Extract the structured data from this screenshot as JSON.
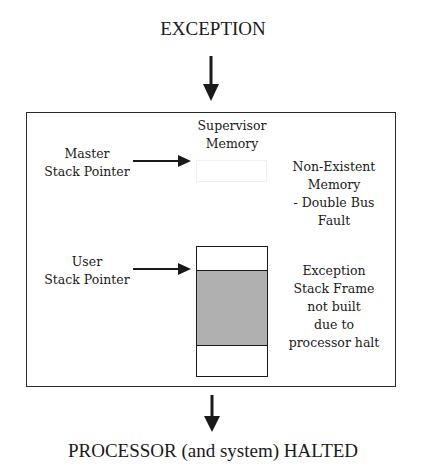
{
  "diagram": {
    "top_label": "EXCEPTION",
    "bottom_label": "PROCESSOR (and system) HALTED",
    "memory_region": {
      "title_line1": "Supervisor",
      "title_line2": "Memory"
    },
    "pointers": {
      "master": {
        "line1": "Master",
        "line2": "Stack Pointer"
      },
      "user": {
        "line1": "User",
        "line2": "Stack Pointer"
      }
    },
    "annotations": {
      "non_existent": [
        "Non-Existent",
        "Memory",
        "- Double Bus",
        "Fault"
      ],
      "stack_frame": [
        "Exception",
        "Stack Frame",
        "not built",
        "due to",
        "processor halt"
      ]
    },
    "colors": {
      "line": "#1a1a1a",
      "shaded_frame": "#c4c4c4",
      "background": "#ffffff"
    }
  }
}
